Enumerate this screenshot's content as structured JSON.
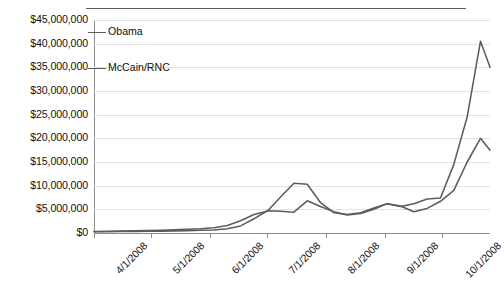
{
  "chart_data": {
    "type": "line",
    "title": "",
    "xlabel": "",
    "ylabel": "",
    "grid": true,
    "legend_position": "inside-top-left",
    "categories": [
      "4/1/2008",
      "5/1/2008",
      "6/1/2008",
      "7/1/2008",
      "8/1/2008",
      "9/1/2008",
      "10/1/2008"
    ],
    "xtick_labels": [
      "4/1/2008",
      "5/1/2008",
      "6/1/2008",
      "7/1/2008",
      "8/1/2008",
      "9/1/2008",
      "10/1/2008"
    ],
    "ytick_labels": [
      "$0",
      "$5,000,000",
      "$10,000,000",
      "$15,000,000",
      "$20,000,000",
      "$25,000,000",
      "$30,000,000",
      "$35,000,000",
      "$40,000,000",
      "$45,000,000"
    ],
    "ytick_values": [
      0,
      5000000,
      10000000,
      15000000,
      20000000,
      25000000,
      30000000,
      35000000,
      40000000,
      45000000
    ],
    "ylim": [
      0,
      45000000
    ],
    "xlim": [
      "4/1/2008",
      "10/26/2008"
    ],
    "series": [
      {
        "name": "Obama",
        "color": "#5c5c5c",
        "x": [
          "4/1/2008",
          "4/8/2008",
          "4/15/2008",
          "4/22/2008",
          "4/29/2008",
          "5/6/2008",
          "5/13/2008",
          "5/20/2008",
          "5/27/2008",
          "6/3/2008",
          "6/10/2008",
          "6/17/2008",
          "6/24/2008",
          "7/1/2008",
          "7/8/2008",
          "7/15/2008",
          "7/22/2008",
          "7/29/2008",
          "8/5/2008",
          "8/12/2008",
          "8/19/2008",
          "8/26/2008",
          "9/2/2008",
          "9/9/2008",
          "9/16/2008",
          "9/23/2008",
          "9/30/2008",
          "10/7/2008",
          "10/14/2008",
          "10/21/2008",
          "10/26/2008"
        ],
        "values": [
          300000,
          350000,
          400000,
          450000,
          500000,
          600000,
          700000,
          800000,
          900000,
          1100000,
          1600000,
          2600000,
          3900000,
          4600000,
          7600000,
          10500000,
          10300000,
          6400000,
          4300000,
          3900000,
          4300000,
          5300000,
          6200000,
          5600000,
          6200000,
          7200000,
          7400000,
          14500000,
          24500000,
          40500000,
          35000000
        ]
      },
      {
        "name": "McCain/RNC",
        "color": "#5c5c5c",
        "x": [
          "4/1/2008",
          "4/8/2008",
          "4/15/2008",
          "4/22/2008",
          "4/29/2008",
          "5/6/2008",
          "5/13/2008",
          "5/20/2008",
          "5/27/2008",
          "6/3/2008",
          "6/10/2008",
          "6/17/2008",
          "6/24/2008",
          "7/1/2008",
          "7/8/2008",
          "7/15/2008",
          "7/22/2008",
          "7/29/2008",
          "8/5/2008",
          "8/12/2008",
          "8/19/2008",
          "8/26/2008",
          "9/2/2008",
          "9/9/2008",
          "9/16/2008",
          "9/23/2008",
          "9/30/2008",
          "10/7/2008",
          "10/14/2008",
          "10/21/2008",
          "10/26/2008"
        ],
        "values": [
          250000,
          280000,
          300000,
          330000,
          360000,
          400000,
          450000,
          500000,
          560000,
          650000,
          900000,
          1500000,
          3000000,
          4700000,
          4600000,
          4400000,
          6800000,
          5600000,
          4500000,
          3800000,
          4100000,
          5000000,
          6200000,
          5700000,
          4500000,
          5200000,
          6700000,
          9000000,
          15000000,
          20000000,
          17500000
        ]
      }
    ],
    "annotations": []
  },
  "legend": {
    "entries": [
      {
        "label": "Obama",
        "marker": "line-swatch"
      },
      {
        "label": "McCain/RNC",
        "marker": "line-swatch"
      }
    ]
  }
}
